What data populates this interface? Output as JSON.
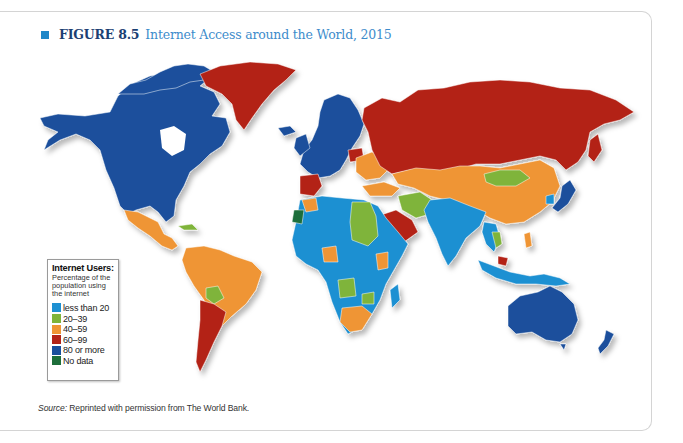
{
  "figure": {
    "label": "FIGURE 8.5",
    "title": "Internet Access around the World, 2015",
    "marker_color": "#1f87c8"
  },
  "legend": {
    "title": "Internet Users:",
    "subtitle": "Percentage of the population using the internet",
    "items": [
      {
        "label": "less than 20",
        "color": "#1e90d2"
      },
      {
        "label": "20–39",
        "color": "#7fb43a"
      },
      {
        "label": "40–59",
        "color": "#ef9534"
      },
      {
        "label": "60–99",
        "color": "#b32317"
      },
      {
        "label": "80 or more",
        "color": "#1a4f9c"
      },
      {
        "label": "No data",
        "color": "#1d6e3a"
      }
    ]
  },
  "source": {
    "prefix": "Source:",
    "text": " Reprinted with permission from The World Bank."
  },
  "map": {
    "type": "choropleth world map",
    "regions": [
      {
        "name": "North America (USA, Canada)",
        "category": "80 or more"
      },
      {
        "name": "Greenland",
        "category": "60–99"
      },
      {
        "name": "Mexico",
        "category": "40–59"
      },
      {
        "name": "South America (Brazil, Colombia, Peru, Venezuela)",
        "category": "40–59"
      },
      {
        "name": "Bolivia",
        "category": "20–39"
      },
      {
        "name": "Argentina / Chile",
        "category": "60–99"
      },
      {
        "name": "Western / Northern Europe",
        "category": "80 or more"
      },
      {
        "name": "Eastern Europe / Ukraine",
        "category": "40–59"
      },
      {
        "name": "Spain / Portugal / Poland",
        "category": "60–99"
      },
      {
        "name": "Russia",
        "category": "60–99"
      },
      {
        "name": "Kazakhstan / China",
        "category": "40–59"
      },
      {
        "name": "Mongolia",
        "category": "20–39"
      },
      {
        "name": "Japan / South Korea",
        "category": "80 or more"
      },
      {
        "name": "Iran / Egypt / Sudan",
        "category": "20–39"
      },
      {
        "name": "Saudi Arabia",
        "category": "60–99"
      },
      {
        "name": "India / Pakistan / most of Africa",
        "category": "less than 20"
      },
      {
        "name": "Nigeria / Kenya / South Africa / Morocco",
        "category": "40–59"
      },
      {
        "name": "Angola / Zimbabwe",
        "category": "20–39"
      },
      {
        "name": "Western Sahara",
        "category": "No data"
      },
      {
        "name": "Australia / New Zealand",
        "category": "80 or more"
      },
      {
        "name": "Indonesia / Papua New Guinea",
        "category": "less than 20"
      },
      {
        "name": "Malaysia",
        "category": "60–99"
      }
    ]
  }
}
